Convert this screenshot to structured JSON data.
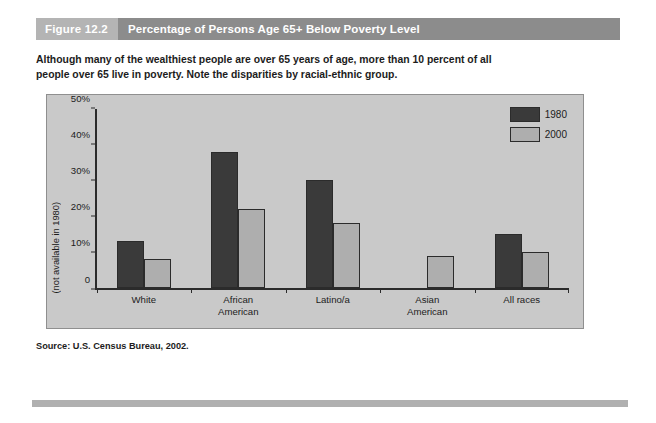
{
  "figure": {
    "number_label": "Figure 12.2",
    "title": "Percentage of Persons Age 65+ Below Poverty Level",
    "caption": "Although many of the wealthiest people are over 65 years of age, more than 10 percent of all people over 65 live in poverty. Note the disparities by racial-ethnic group.",
    "source": "Source: U.S. Census Bureau, 2002."
  },
  "annotations": {
    "asian_american_note": "(not available in 1980)"
  },
  "colors": {
    "series_1980": "#3a3a3a",
    "series_2000": "#aeaeae",
    "panel_background": "#c9c9c9",
    "header_number_band": "#b4b4b4",
    "header_title_band": "#8c8c8c",
    "axis": "#2b2b2b"
  },
  "chart_data": {
    "type": "bar",
    "title": "Percentage of Persons Age 65+ Below Poverty Level",
    "xlabel": "",
    "ylabel": "",
    "ylim": [
      0,
      50
    ],
    "yticks": [
      "0",
      "10%",
      "20%",
      "30%",
      "40%",
      "50%"
    ],
    "ytick_values": [
      0,
      10,
      20,
      30,
      40,
      50
    ],
    "grid": false,
    "legend_position": "top-right",
    "categories": [
      "White",
      "African American",
      "Latino/a",
      "Asian American",
      "All races"
    ],
    "category_lines": [
      [
        "White"
      ],
      [
        "African",
        "American"
      ],
      [
        "Latino/a"
      ],
      [
        "Asian",
        "American"
      ],
      [
        "All races"
      ]
    ],
    "series": [
      {
        "name": "1980",
        "color": "#3a3a3a",
        "values": [
          13,
          38,
          30,
          null,
          15
        ]
      },
      {
        "name": "2000",
        "color": "#aeaeae",
        "values": [
          8,
          22,
          18,
          9,
          10
        ]
      }
    ]
  }
}
